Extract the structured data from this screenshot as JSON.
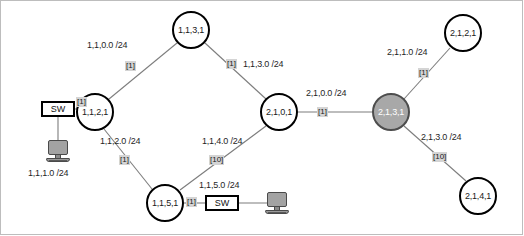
{
  "diagram": {
    "colors": {
      "node_fill": "#ffffff",
      "node_stroke": "#000000",
      "highlight_fill": "#a8a8a8",
      "highlight_stroke": "#4d4d4d",
      "metric_badge_bg": "#d4d4d4",
      "link_stroke": "#7d7d7d",
      "host_fill": "#a3a3a3",
      "frame_stroke": "#bdbdbd"
    },
    "routers": [
      {
        "id": "r_1_1_3_1",
        "label": "1,1,3,1",
        "x": 191,
        "y": 30,
        "r": 19,
        "highlight": false
      },
      {
        "id": "r_1_1_2_1",
        "label": "1,1,2,1",
        "x": 95,
        "y": 112,
        "r": 19,
        "highlight": false
      },
      {
        "id": "r_1_1_5_1",
        "label": "1,1,5,1",
        "x": 165,
        "y": 203,
        "r": 19,
        "highlight": false
      },
      {
        "id": "r_2_1_0_1",
        "label": "2,1,0,1",
        "x": 279,
        "y": 112,
        "r": 19,
        "highlight": false
      },
      {
        "id": "r_2_1_3_1",
        "label": "2,1,3,1",
        "x": 391,
        "y": 112,
        "r": 19,
        "highlight": true
      },
      {
        "id": "r_2_1_2_1",
        "label": "2,1,2,1",
        "x": 463,
        "y": 33,
        "r": 19,
        "highlight": false
      },
      {
        "id": "r_2_1_4_1",
        "label": "2,1,4,1",
        "x": 478,
        "y": 196,
        "r": 19,
        "highlight": false
      }
    ],
    "switches": [
      {
        "id": "sw_left",
        "label": "SW",
        "x": 41,
        "y": 101,
        "w": 34,
        "h": 16
      },
      {
        "id": "sw_bottom",
        "label": "SW",
        "x": 205,
        "y": 195,
        "w": 34,
        "h": 16
      }
    ],
    "hosts": [
      {
        "id": "host_left",
        "x": 46,
        "y": 140
      },
      {
        "id": "host_bottom",
        "x": 265,
        "y": 192
      }
    ],
    "links": [
      {
        "id": "l_1_1_0_0",
        "from": "r_1_1_2_1",
        "to": "r_1_1_3_1"
      },
      {
        "id": "l_1_1_3_0",
        "from": "r_1_1_3_1",
        "to": "r_2_1_0_1"
      },
      {
        "id": "l_1_1_2_0",
        "from": "r_1_1_2_1",
        "to": "r_1_1_5_1"
      },
      {
        "id": "l_1_1_4_0",
        "from": "r_1_1_5_1",
        "to": "r_2_1_0_1"
      },
      {
        "id": "l_2_1_0_0",
        "from": "r_2_1_0_1",
        "to": "r_2_1_3_1"
      },
      {
        "id": "l_2_1_1_0",
        "from": "r_2_1_3_1",
        "to": "r_2_1_2_1"
      },
      {
        "id": "l_2_1_3_0",
        "from": "r_2_1_3_1",
        "to": "r_2_1_4_1"
      },
      {
        "id": "l_sw_left",
        "from": "sw_left",
        "to": "r_1_1_2_1"
      },
      {
        "id": "l_sw_left_host",
        "from": "sw_left",
        "to": "host_left"
      },
      {
        "id": "l_sw_bottom",
        "from": "r_1_1_5_1",
        "to": "sw_bottom"
      },
      {
        "id": "l_sw_bottom_host",
        "from": "sw_bottom",
        "to": "host_bottom"
      }
    ],
    "network_labels": [
      {
        "id": "n_1_1_0_0",
        "text": "1,1,0.0  /24",
        "x": 87,
        "y": 40
      },
      {
        "id": "n_1_1_3_0",
        "text": "1,1,3.0  /24",
        "x": 243,
        "y": 59
      },
      {
        "id": "n_2_1_0_0",
        "text": "2,1,0.0  /24",
        "x": 306,
        "y": 88
      },
      {
        "id": "n_2_1_1_0",
        "text": "2,1,1.0  /24",
        "x": 387,
        "y": 47
      },
      {
        "id": "n_1_1_2_0",
        "text": "1,1,2.0  /24",
        "x": 100,
        "y": 136
      },
      {
        "id": "n_1_1_4_0",
        "text": "1,1,4.0  /24",
        "x": 202,
        "y": 136
      },
      {
        "id": "n_2_1_3_0",
        "text": "2,1,3.0  /24",
        "x": 421,
        "y": 132
      },
      {
        "id": "n_1_1_5_0",
        "text": "1,1,5.0  /24",
        "x": 199,
        "y": 180
      },
      {
        "id": "n_1_1_1_0",
        "text": "1,1,1.0  /24",
        "x": 28,
        "y": 168
      }
    ],
    "metrics": [
      {
        "id": "m_1_1_0_0",
        "text": "[1]",
        "x": 125,
        "y": 61
      },
      {
        "id": "m_1_1_3_0",
        "text": "[1]",
        "x": 226,
        "y": 59
      },
      {
        "id": "m_2_1_0_0",
        "text": "[1]",
        "x": 317,
        "y": 107
      },
      {
        "id": "m_2_1_1_0",
        "text": "[1]",
        "x": 418,
        "y": 68
      },
      {
        "id": "m_1_1_2_0",
        "text": "[1]",
        "x": 119,
        "y": 155
      },
      {
        "id": "m_1_1_4_0",
        "text": "[10]",
        "x": 209,
        "y": 155
      },
      {
        "id": "m_2_1_3_0",
        "text": "[10]",
        "x": 432,
        "y": 152
      },
      {
        "id": "m_sw_left",
        "text": "[1]",
        "x": 76,
        "y": 97
      },
      {
        "id": "m_sw_bottom",
        "text": "[1]",
        "x": 186,
        "y": 197
      }
    ]
  }
}
